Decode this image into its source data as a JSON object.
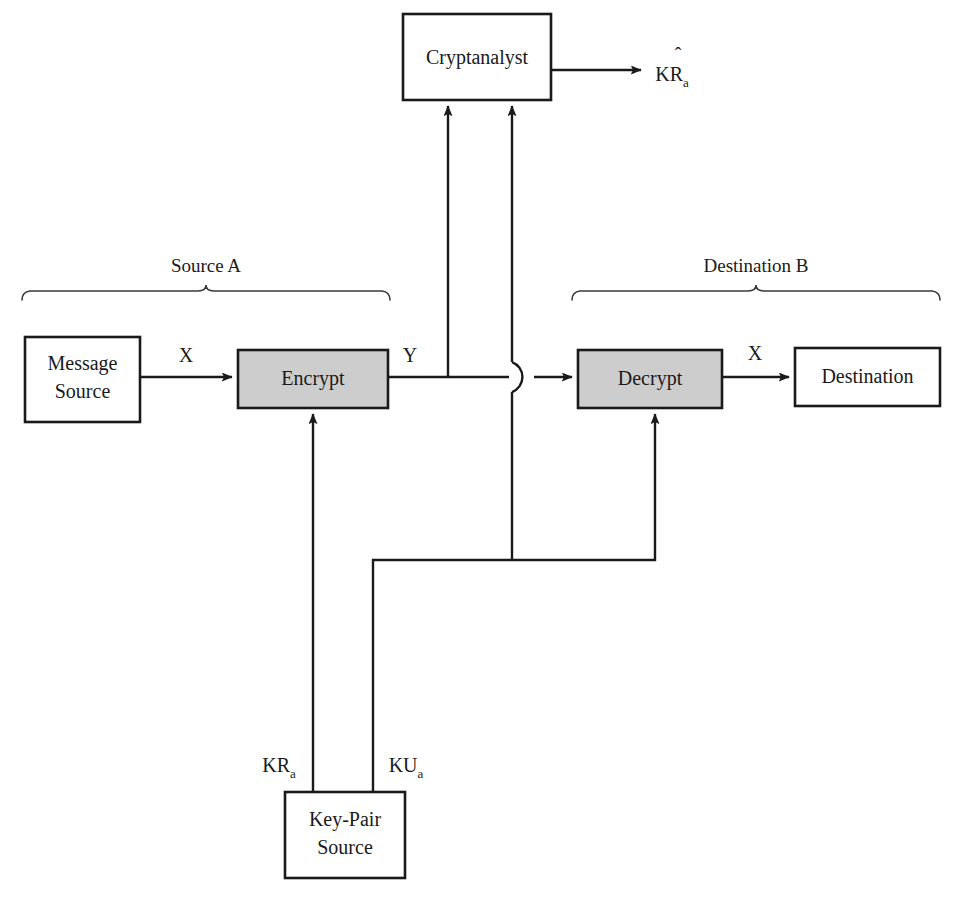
{
  "diagram": {
    "accent_shaded": "#cdcdcd",
    "stroke_color": "#1a1a1a",
    "background": "#ffffff",
    "boxes": [
      {
        "id": "message-source",
        "label_line1": "Message",
        "label_line2": "Source",
        "shaded": false
      },
      {
        "id": "encrypt",
        "label_line1": "Encrypt",
        "label_line2": "",
        "shaded": true
      },
      {
        "id": "decrypt",
        "label_line1": "Decrypt",
        "label_line2": "",
        "shaded": true
      },
      {
        "id": "destination",
        "label_line1": "Destination",
        "label_line2": "",
        "shaded": false
      },
      {
        "id": "cryptanalyst",
        "label_line1": "Cryptanalyst",
        "label_line2": "",
        "shaded": false
      },
      {
        "id": "key-pair-source",
        "label_line1": "Key-Pair",
        "label_line2": "Source",
        "shaded": false
      }
    ],
    "edge_labels": {
      "plaintext_in": "X",
      "ciphertext": "Y",
      "plaintext_out": "X",
      "private_key": {
        "base": "KR",
        "subscript": "a"
      },
      "public_key": {
        "base": "KU",
        "subscript": "a"
      },
      "estimated_key": {
        "hat": "ˆ",
        "base": "KR",
        "subscript": "a"
      }
    },
    "group_labels": {
      "source": "Source A",
      "destination": "Destination B"
    }
  }
}
